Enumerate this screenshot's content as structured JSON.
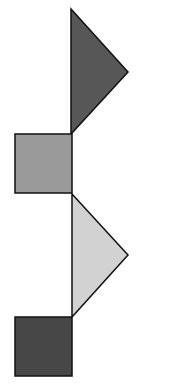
{
  "canvas": {
    "width": 173,
    "height": 389,
    "background": "#ffffff"
  },
  "shapes": [
    {
      "type": "triangle",
      "points": "71,9 128,72 71,134",
      "fill": "#575757",
      "stroke": "#111111"
    },
    {
      "type": "square",
      "x": 15,
      "y": 134,
      "w": 57,
      "h": 59,
      "fill": "#9a9a9a",
      "stroke": "#111111"
    },
    {
      "type": "triangle",
      "points": "72,194 128,255 72,317",
      "fill": "#d2d2d2",
      "stroke": "#111111"
    },
    {
      "type": "square",
      "x": 15,
      "y": 317,
      "w": 57,
      "h": 59,
      "fill": "#474747",
      "stroke": "#111111"
    }
  ]
}
